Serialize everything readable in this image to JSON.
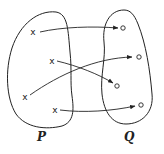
{
  "diagram": {
    "type": "mapping",
    "sets": [
      {
        "label": "P",
        "elements": [
          {
            "id": "p1",
            "marker": "x"
          },
          {
            "id": "p2",
            "marker": "x"
          },
          {
            "id": "p3",
            "marker": "x"
          },
          {
            "id": "p4",
            "marker": "x"
          }
        ]
      },
      {
        "label": "Q",
        "elements": [
          {
            "id": "q1",
            "marker": "o"
          },
          {
            "id": "q2",
            "marker": "o"
          },
          {
            "id": "q3",
            "marker": "o"
          },
          {
            "id": "q4",
            "marker": "o"
          }
        ]
      }
    ],
    "arrows": [
      {
        "from": "p1",
        "to": "q1"
      },
      {
        "from": "p2",
        "to": "q3"
      },
      {
        "from": "p3",
        "to": "q2"
      },
      {
        "from": "p4",
        "to": "q4"
      }
    ],
    "colors": {
      "stroke": "#222222",
      "background": "#ffffff"
    }
  },
  "labels": {
    "set_p": "P",
    "set_q": "Q"
  },
  "markers": {
    "cross": "x",
    "circle": "o"
  }
}
